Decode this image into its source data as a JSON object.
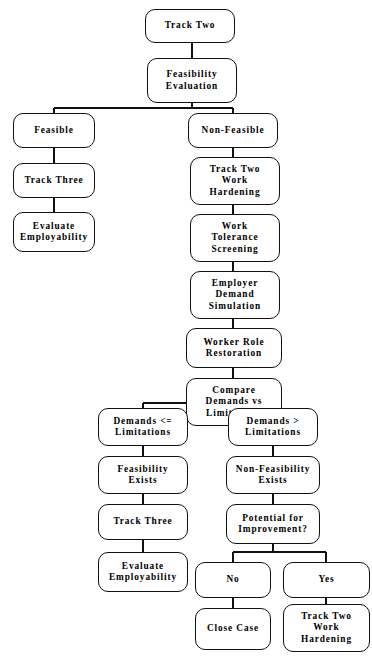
{
  "diagram": {
    "caption": "",
    "stroke_color": "#101010",
    "background_color": "#ffffff",
    "text_color": "#000000",
    "nodes": [
      {
        "id": "track-two",
        "label": "Track Two",
        "x": 145,
        "y": 9,
        "w": 90,
        "h": 34
      },
      {
        "id": "feasibility-evaluation",
        "label": "Feasibility\nEvaluation",
        "x": 147,
        "y": 58,
        "w": 90,
        "h": 45
      },
      {
        "id": "feasible",
        "label": "Feasible",
        "x": 13,
        "y": 113,
        "w": 82,
        "h": 35
      },
      {
        "id": "non-feasible",
        "label": "Non-Feasible",
        "x": 188,
        "y": 113,
        "w": 90,
        "h": 35
      },
      {
        "id": "track-three-upper",
        "label": "Track Three",
        "x": 13,
        "y": 163,
        "w": 82,
        "h": 35
      },
      {
        "id": "track-two-work-hardening-upper",
        "label": "Track Two\nWork\nHardening",
        "x": 190,
        "y": 157,
        "w": 90,
        "h": 48
      },
      {
        "id": "evaluate-employability-upper",
        "label": "Evaluate\nEmployability",
        "x": 13,
        "y": 212,
        "w": 82,
        "h": 40
      },
      {
        "id": "work-tolerance-screening",
        "label": "Work\nTolerance\nScreening",
        "x": 190,
        "y": 214,
        "w": 90,
        "h": 48
      },
      {
        "id": "employer-demand-simulation",
        "label": "Employer\nDemand\nSimulation",
        "x": 190,
        "y": 271,
        "w": 90,
        "h": 48
      },
      {
        "id": "worker-role-restoration",
        "label": "Worker Role\nRestoration",
        "x": 186,
        "y": 328,
        "w": 96,
        "h": 40
      },
      {
        "id": "compare-demands-vs-limitations",
        "label": "Compare\nDemands vs\nLimitations",
        "x": 186,
        "y": 378,
        "w": 96,
        "h": 48
      },
      {
        "id": "demands-le-limitations",
        "label": "Demands <=\nLimitations",
        "x": 98,
        "y": 408,
        "w": 90,
        "h": 38
      },
      {
        "id": "demands-gt-limitations",
        "label": "Demands >\nLimitations",
        "x": 228,
        "y": 408,
        "w": 90,
        "h": 38
      },
      {
        "id": "feasibility-exists",
        "label": "Feasibility\nExists",
        "x": 98,
        "y": 456,
        "w": 90,
        "h": 38
      },
      {
        "id": "non-feasibility-exists",
        "label": "Non-Feasibility\nExists",
        "x": 226,
        "y": 456,
        "w": 94,
        "h": 38
      },
      {
        "id": "track-three-lower",
        "label": "Track Three",
        "x": 98,
        "y": 504,
        "w": 90,
        "h": 36
      },
      {
        "id": "potential-for-improvement",
        "label": "Potential for\nImprovement?",
        "x": 226,
        "y": 504,
        "w": 94,
        "h": 40
      },
      {
        "id": "evaluate-employability-lower",
        "label": "Evaluate\nEmployability",
        "x": 98,
        "y": 552,
        "w": 90,
        "h": 40
      },
      {
        "id": "no",
        "label": "No",
        "x": 195,
        "y": 562,
        "w": 76,
        "h": 36
      },
      {
        "id": "yes",
        "label": "Yes",
        "x": 283,
        "y": 562,
        "w": 87,
        "h": 36
      },
      {
        "id": "close-case",
        "label": "Close Case",
        "x": 195,
        "y": 608,
        "w": 76,
        "h": 42
      },
      {
        "id": "track-two-work-hardening-lower",
        "label": "Track Two\nWork\nHardening",
        "x": 283,
        "y": 604,
        "w": 87,
        "h": 48
      }
    ],
    "connectors": [
      {
        "id": "track-two-to-feasibility-evaluation",
        "type": "vertical",
        "x": 192,
        "y1": 43,
        "y2": 58
      },
      {
        "id": "feasibility-evaluation-split",
        "type": "split",
        "y_stem_top": 103,
        "y_bar": 108,
        "x_center": 192,
        "x_left": 54,
        "x_right": 233,
        "y_bar_end": 113
      },
      {
        "id": "feasible-to-track-three",
        "type": "vertical",
        "x": 54,
        "y1": 148,
        "y2": 163
      },
      {
        "id": "track-three-to-evaluate",
        "type": "vertical",
        "x": 54,
        "y1": 198,
        "y2": 212
      },
      {
        "id": "non-feasible-to-work-hardening",
        "type": "vertical",
        "x": 233,
        "y1": 148,
        "y2": 157
      },
      {
        "id": "work-hardening-to-tolerance",
        "type": "vertical",
        "x": 233,
        "y1": 205,
        "y2": 214
      },
      {
        "id": "tolerance-to-employer-demand",
        "type": "vertical",
        "x": 233,
        "y1": 262,
        "y2": 271
      },
      {
        "id": "employer-demand-to-worker-role",
        "type": "vertical",
        "x": 233,
        "y1": 319,
        "y2": 328
      },
      {
        "id": "worker-role-to-compare",
        "type": "vertical",
        "x": 233,
        "y1": 368,
        "y2": 378
      },
      {
        "id": "compare-split",
        "type": "split",
        "y_stem_top": 426,
        "y_bar": 403,
        "x_center": 233,
        "x_left": 143,
        "x_right": 273,
        "y_bar_end": 408
      },
      {
        "id": "demands-le-to-feasibility-exists",
        "type": "vertical",
        "x": 143,
        "y1": 446,
        "y2": 456
      },
      {
        "id": "feasibility-exists-to-track-three",
        "type": "vertical",
        "x": 143,
        "y1": 494,
        "y2": 504
      },
      {
        "id": "track-three-to-evaluate-lower",
        "type": "vertical",
        "x": 143,
        "y1": 540,
        "y2": 552
      },
      {
        "id": "demands-gt-to-non-feasibility",
        "type": "vertical",
        "x": 273,
        "y1": 446,
        "y2": 456
      },
      {
        "id": "non-feasibility-to-potential",
        "type": "vertical",
        "x": 273,
        "y1": 494,
        "y2": 504
      },
      {
        "id": "potential-split",
        "type": "split",
        "y_stem_top": 544,
        "y_bar": 552,
        "x_center": 273,
        "x_left": 233,
        "x_right": 326,
        "y_bar_end": 562
      },
      {
        "id": "no-to-close-case",
        "type": "vertical",
        "x": 233,
        "y1": 598,
        "y2": 608
      },
      {
        "id": "yes-to-work-hardening",
        "type": "vertical",
        "x": 326,
        "y1": 598,
        "y2": 604
      }
    ]
  }
}
